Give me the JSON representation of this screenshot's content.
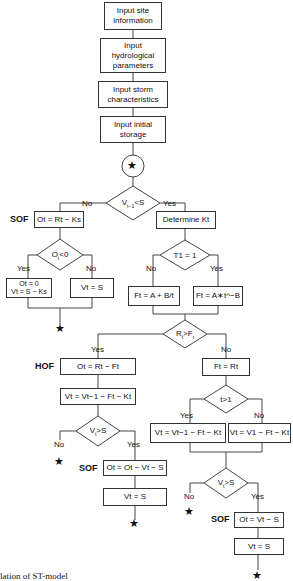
{
  "diagram": {
    "title_caption": "lation of ST-model",
    "inputs": [
      "Input site\ninformation",
      "Input\nhydrological\nparameters",
      "Input storm\ncharacteristics",
      "Input initial\nstorage"
    ],
    "connector_symbol": "★",
    "decisions": {
      "d1": "V t-1<S",
      "d2": "Ot<0",
      "d3": "T1 = 1",
      "d4": "Rt>Ft",
      "d5": "Vt>S",
      "d6": "t>1",
      "d7": "Vt>S"
    },
    "processes": {
      "sof1": "Ot = Rt − Ks",
      "o0": "Ot = 0\nVt = S − Ks",
      "vs1": "Vt = S",
      "detk": "Determine Kt",
      "f1": "Ft = A + B/t",
      "f2": "Ft = A∗t^−B",
      "hof": "Ot = Rt − Ft",
      "v1": "Vt = Vt−1 − Ft − Kt",
      "sof2": "Ot = Ot − Vt − S",
      "vs2": "Vt = S",
      "fr": "Ft = Rt",
      "v2": "Vt = Vt−1 − Ft − Kt",
      "v3": "Vt = V1 − Ft − Kt",
      "sof3": "Ot = Vt − S",
      "vs3": "Vt = S"
    },
    "side_labels": {
      "sof": "SOF",
      "hof": "HOF"
    },
    "branch_labels": {
      "yes": "Yes",
      "no": "No"
    }
  }
}
